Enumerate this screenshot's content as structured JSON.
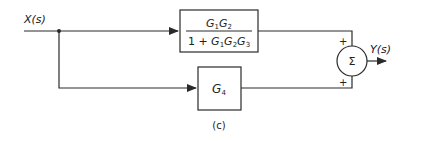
{
  "diagram": {
    "type": "block-diagram",
    "caption": "(c)",
    "input": {
      "label": "X(s)"
    },
    "output": {
      "label": "Y(s)"
    },
    "blocks": [
      {
        "id": "top",
        "numerator": "G1G2",
        "denominator": "1 + G1G2G3",
        "num_parts": [
          "G",
          "1",
          "G",
          "2"
        ],
        "den_parts": [
          "1 + G",
          "1",
          "G",
          "2",
          "G",
          "3"
        ]
      },
      {
        "id": "bottom",
        "label_main": "G",
        "label_sub": "4"
      }
    ],
    "summer": {
      "symbol": "Σ",
      "top_sign": "+",
      "bottom_sign": "+"
    },
    "colors": {
      "line": "#2a2a2a",
      "background": "#ffffff"
    }
  }
}
